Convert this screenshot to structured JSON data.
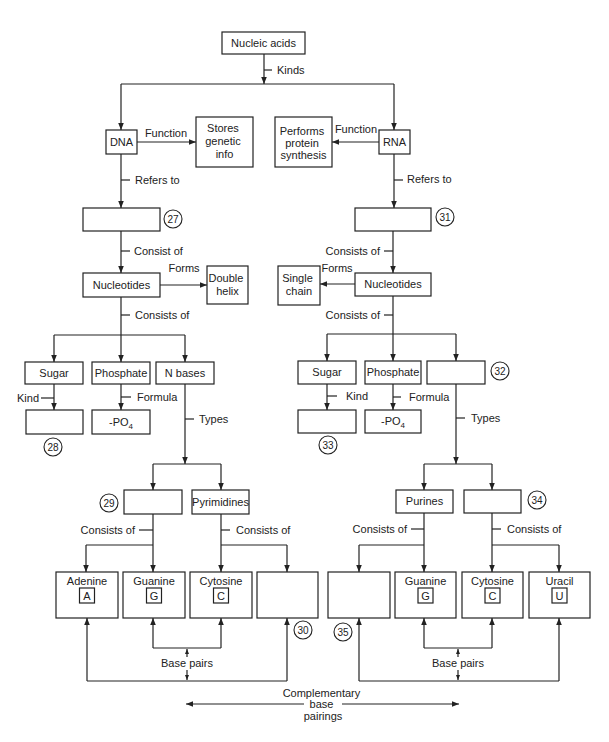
{
  "diagram": {
    "root": "Nucleic acids",
    "kinds_label": "Kinds",
    "dna": {
      "name": "DNA",
      "function_label": "Function",
      "function_lines": [
        "Stores",
        "genetic",
        "info"
      ],
      "refers_to_label": "Refers to",
      "refers_to_answer": "",
      "refers_to_marker": "27",
      "consist_of_label": "Consist of",
      "nucleotides": "Nucleotides",
      "forms_label": "Forms",
      "forms_lines": [
        "Double",
        "helix"
      ],
      "consists_of_label": "Consists of",
      "sugar": "Sugar",
      "phosphate": "Phosphate",
      "n_bases": "N bases",
      "kind_label": "Kind",
      "sugar_kind_answer": "",
      "sugar_kind_marker": "28",
      "formula_label": "Formula",
      "formula": {
        "text": "-PO",
        "subscript": "4"
      },
      "types_label": "Types",
      "purines_answer": "",
      "purines_marker": "29",
      "pyrimidines": "Pyrimidines",
      "purines_consists_label": "Consists of",
      "pyrimidines_consists_label": "Consists of",
      "bases": [
        {
          "name": "Adenine",
          "letter": "A"
        },
        {
          "name": "Guanine",
          "letter": "G"
        },
        {
          "name": "Cytosine",
          "letter": "C"
        },
        {
          "name": "",
          "letter": "",
          "marker": "30"
        }
      ],
      "base_pairs_label": "Base pairs"
    },
    "rna": {
      "name": "RNA",
      "function_label": "Function",
      "function_lines": [
        "Performs",
        "protein",
        "synthesis"
      ],
      "refers_to_label": "Refers to",
      "refers_to_answer": "",
      "refers_to_marker": "31",
      "consists_of_label_1": "Consists of",
      "nucleotides": "Nucleotides",
      "forms_label": "Forms",
      "forms_lines": [
        "Single",
        "chain"
      ],
      "consists_of_label_2": "Consists of",
      "sugar": "Sugar",
      "phosphate": "Phosphate",
      "n_bases_answer": "",
      "n_bases_marker": "32",
      "kind_label": "Kind",
      "sugar_kind_answer": "",
      "sugar_kind_marker": "33",
      "formula_label": "Formula",
      "formula": {
        "text": "-PO",
        "subscript": "4"
      },
      "types_label": "Types",
      "purines": "Purines",
      "pyrimidines_answer": "",
      "pyrimidines_marker": "34",
      "purines_consists_label": "Consists of",
      "pyrimidines_consists_label": "Consists of",
      "bases": [
        {
          "name": "",
          "letter": "",
          "marker": "35"
        },
        {
          "name": "Guanine",
          "letter": "G"
        },
        {
          "name": "Cytosine",
          "letter": "C"
        },
        {
          "name": "Uracil",
          "letter": "U"
        }
      ],
      "base_pairs_label": "Base pairs"
    },
    "complementary_label_lines": [
      "Complementary",
      "base",
      "pairings"
    ]
  },
  "colors": {
    "line": "#222222",
    "background": "#ffffff"
  }
}
